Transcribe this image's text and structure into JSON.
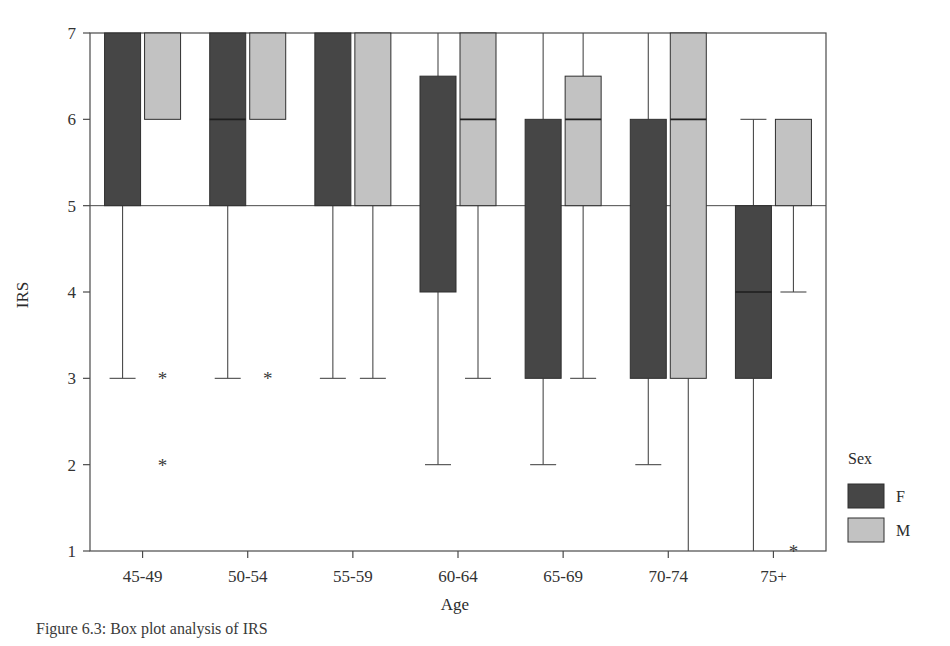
{
  "chart_data": {
    "type": "box",
    "title": "",
    "xlabel": "Age",
    "ylabel": "IRS",
    "categories": [
      "45-49",
      "50-54",
      "55-59",
      "60-64",
      "65-69",
      "70-74",
      "75+"
    ],
    "ylim": [
      1,
      7
    ],
    "yticks": [
      1,
      2,
      3,
      4,
      5,
      6,
      7
    ],
    "ytick_labels": [
      "1",
      "2",
      "3",
      "4",
      "5",
      "6",
      "7"
    ],
    "grid": false,
    "legend": {
      "title": "Sex",
      "position": "right",
      "entries": [
        {
          "label": "F",
          "color": "#464646"
        },
        {
          "label": "M",
          "color": "#c2c2c2"
        }
      ]
    },
    "series": [
      {
        "name": "F",
        "color": "#464646",
        "boxes": [
          {
            "category": "45-49",
            "q1": 5,
            "median": 7,
            "q3": 7,
            "whisker_low": 3,
            "whisker_high": 7,
            "outliers": []
          },
          {
            "category": "50-54",
            "q1": 5,
            "median": 6,
            "q3": 7,
            "whisker_low": 3,
            "whisker_high": 7,
            "outliers": []
          },
          {
            "category": "55-59",
            "q1": 5,
            "median": 7,
            "q3": 7,
            "whisker_low": 3,
            "whisker_high": 7,
            "outliers": []
          },
          {
            "category": "60-64",
            "q1": 4,
            "median": 6.5,
            "q3": 6.5,
            "whisker_low": 2,
            "whisker_high": 7,
            "outliers": []
          },
          {
            "category": "65-69",
            "q1": 3,
            "median": 6,
            "q3": 6,
            "whisker_low": 2,
            "whisker_high": 7,
            "outliers": []
          },
          {
            "category": "70-74",
            "q1": 3,
            "median": 6,
            "q3": 6,
            "whisker_low": 2,
            "whisker_high": 7,
            "outliers": []
          },
          {
            "category": "75+",
            "q1": 3,
            "median": 4,
            "q3": 5,
            "whisker_low": 1,
            "whisker_high": 6,
            "outliers": []
          }
        ]
      },
      {
        "name": "M",
        "color": "#c2c2c2",
        "boxes": [
          {
            "category": "45-49",
            "q1": 6,
            "median": 7,
            "q3": 7,
            "whisker_low": 6,
            "whisker_high": 7,
            "outliers": [
              3,
              2
            ]
          },
          {
            "category": "50-54",
            "q1": 6,
            "median": 7,
            "q3": 7,
            "whisker_low": 6,
            "whisker_high": 7,
            "outliers": [
              3
            ]
          },
          {
            "category": "55-59",
            "q1": 5,
            "median": 7,
            "q3": 7,
            "whisker_low": 3,
            "whisker_high": 7,
            "outliers": []
          },
          {
            "category": "60-64",
            "q1": 5,
            "median": 6,
            "q3": 7,
            "whisker_low": 3,
            "whisker_high": 7,
            "outliers": []
          },
          {
            "category": "65-69",
            "q1": 5,
            "median": 6,
            "q3": 6.5,
            "whisker_low": 3,
            "whisker_high": 7,
            "outliers": []
          },
          {
            "category": "70-74",
            "q1": 3,
            "median": 6,
            "q3": 7,
            "whisker_low": 1,
            "whisker_high": 7,
            "outliers": []
          },
          {
            "category": "75+",
            "q1": 5,
            "median": 6,
            "q3": 6,
            "whisker_low": 4,
            "whisker_high": 6,
            "outliers": [
              1
            ]
          }
        ]
      }
    ]
  },
  "axis": {
    "y_title": "IRS",
    "x_title": "Age"
  },
  "legend": {
    "title": "Sex",
    "f_label": "F",
    "m_label": "M"
  },
  "ticks": {
    "y": [
      "7",
      "6",
      "5",
      "4",
      "3",
      "2",
      "1"
    ],
    "x": [
      "45-49",
      "50-54",
      "55-59",
      "60-64",
      "65-69",
      "70-74",
      "75+"
    ]
  },
  "caption": {
    "text": "Figure 6.3:  Box plot analysis of IRS"
  },
  "colors": {
    "female": "#464646",
    "male": "#c2c2c2",
    "axis": "#4a4a4a",
    "background": "#ffffff"
  }
}
